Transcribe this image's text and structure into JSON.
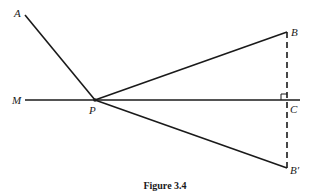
{
  "figure": {
    "caption": "Figure 3.4",
    "points": {
      "A": {
        "label": "A",
        "x": 25,
        "y": 15
      },
      "M": {
        "label": "M",
        "x": 25,
        "y": 100
      },
      "P": {
        "label": "P",
        "x": 95,
        "y": 100
      },
      "B": {
        "label": "B",
        "x": 287,
        "y": 32
      },
      "C": {
        "label": "C",
        "x": 287,
        "y": 100
      },
      "Bprime": {
        "label": "B′",
        "x": 287,
        "y": 168
      }
    },
    "segments": [
      {
        "from": "A",
        "to": "P",
        "style": "solid"
      },
      {
        "from": "M",
        "to": "C",
        "style": "solid"
      },
      {
        "from": "P",
        "to": "B",
        "style": "solid"
      },
      {
        "from": "P",
        "to": "Bprime",
        "style": "solid"
      },
      {
        "from": "B",
        "to": "Bprime",
        "style": "dashed"
      }
    ],
    "right_angle_at": "C",
    "colors": {
      "stroke": "#1a1a1a",
      "background": "#ffffff"
    }
  }
}
